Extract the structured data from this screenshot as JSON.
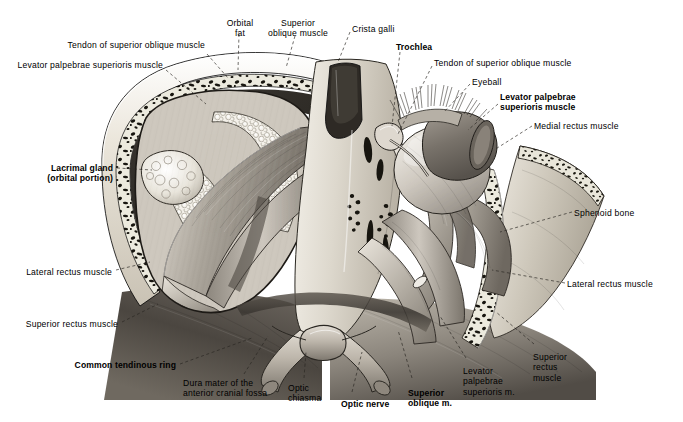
{
  "plate": {
    "title": "Orbital contents, superior view",
    "description": "Anatomical plate: both orbits viewed from above with the orbital roof removed, showing extraocular muscles, lacrimal gland, optic nerves and optic chiasma.",
    "background_color": "#ffffff",
    "ink_color": "#000000"
  },
  "labels": [
    {
      "id": "tendon-superior-oblique-left",
      "text": "Tendon of superior oblique muscle",
      "bold": false,
      "align": "right",
      "x": 205,
      "y": 40,
      "lines": [
        "Tendon of superior oblique muscle"
      ]
    },
    {
      "id": "levator-palpebrae-left",
      "text": "Levator palpebrae superioris muscle",
      "bold": false,
      "align": "right",
      "x": 163,
      "y": 60,
      "lines": [
        "Levator palpebrae superioris muscle"
      ]
    },
    {
      "id": "orbital-fat",
      "text": "Orbital fat",
      "bold": false,
      "align": "center",
      "x": 240,
      "y": 18,
      "lines": [
        "Orbital",
        "fat"
      ]
    },
    {
      "id": "superior-oblique-muscle",
      "text": "Superior oblique muscle",
      "bold": false,
      "align": "center",
      "x": 298,
      "y": 18,
      "lines": [
        "Superior",
        "oblique muscle"
      ]
    },
    {
      "id": "crista-galli",
      "text": "Crista galli",
      "bold": false,
      "align": "left",
      "x": 352,
      "y": 24,
      "lines": [
        "Crista galli"
      ]
    },
    {
      "id": "trochlea",
      "text": "Trochlea",
      "bold": true,
      "align": "left",
      "x": 396,
      "y": 42,
      "lines": [
        "Trochlea"
      ]
    },
    {
      "id": "tendon-superior-oblique-right",
      "text": "Tendon of superior oblique muscle",
      "bold": false,
      "align": "left",
      "x": 434,
      "y": 58,
      "lines": [
        "Tendon of superior oblique muscle"
      ]
    },
    {
      "id": "eyeball",
      "text": "Eyeball",
      "bold": false,
      "align": "left",
      "x": 472,
      "y": 77,
      "lines": [
        "Eyeball"
      ]
    },
    {
      "id": "levator-palpebrae-right",
      "text": "Levator palpebrae superioris muscle",
      "bold": true,
      "align": "left",
      "x": 500,
      "y": 92,
      "lines": [
        "Levator palpebrae",
        "superioris muscle"
      ]
    },
    {
      "id": "medial-rectus-muscle",
      "text": "Medial rectus muscle",
      "bold": false,
      "align": "left",
      "x": 534,
      "y": 121,
      "lines": [
        "Medial rectus muscle"
      ]
    },
    {
      "id": "sphenoid-bone",
      "text": "Sphenoid bone",
      "bold": false,
      "align": "left",
      "x": 574,
      "y": 208,
      "lines": [
        "Sphenoid bone"
      ]
    },
    {
      "id": "lateral-rectus-right",
      "text": "Lateral rectus muscle",
      "bold": false,
      "align": "left",
      "x": 567,
      "y": 279,
      "lines": [
        "Lateral rectus muscle"
      ]
    },
    {
      "id": "superior-rectus-right",
      "text": "Superior rectus muscle",
      "bold": false,
      "align": "left",
      "x": 533,
      "y": 352,
      "lines": [
        "Superior",
        "rectus",
        "muscle"
      ]
    },
    {
      "id": "levator-palpebrae-bottom",
      "text": "Levator palpebrae superioris m.",
      "bold": false,
      "align": "left",
      "x": 463,
      "y": 366,
      "lines": [
        "Levator",
        "palpebrae",
        "superioris m."
      ]
    },
    {
      "id": "superior-oblique-bottom",
      "text": "Superior oblique m.",
      "bold": true,
      "align": "left",
      "x": 408,
      "y": 388,
      "lines": [
        "Superior",
        "oblique m."
      ]
    },
    {
      "id": "optic-nerve",
      "text": "Optic nerve",
      "bold": true,
      "align": "left",
      "x": 341,
      "y": 399,
      "lines": [
        "Optic nerve"
      ]
    },
    {
      "id": "optic-chiasma",
      "text": "Optic chiasma",
      "bold": false,
      "align": "left",
      "x": 288,
      "y": 383,
      "lines": [
        "Optic",
        "chiasma"
      ]
    },
    {
      "id": "dura-mater",
      "text": "Dura mater of the anterior cranial fossa",
      "bold": false,
      "align": "left",
      "x": 183,
      "y": 378,
      "lines": [
        "Dura mater of the",
        "anterior cranial fossa"
      ]
    },
    {
      "id": "common-tendinous-ring",
      "text": "Common tendinous ring",
      "bold": true,
      "align": "right",
      "x": 176,
      "y": 360,
      "lines": [
        "Common tendinous ring"
      ]
    },
    {
      "id": "superior-rectus-left",
      "text": "Superior rectus muscle",
      "bold": false,
      "align": "right",
      "x": 118,
      "y": 319,
      "lines": [
        "Superior rectus muscle"
      ]
    },
    {
      "id": "lateral-rectus-left",
      "text": "Lateral rectus muscle",
      "bold": false,
      "align": "right",
      "x": 112,
      "y": 267,
      "lines": [
        "Lateral rectus muscle"
      ]
    },
    {
      "id": "lacrimal-gland",
      "text": "Lacrimal gland (orbital portion)",
      "bold": true,
      "align": "right",
      "x": 113,
      "y": 163,
      "lines": [
        "Lacrimal gland",
        "(orbital portion)"
      ]
    }
  ],
  "structures": {
    "bone_compact": "#d8d2c6",
    "bone_diploe_dark": "#16140f",
    "muscle_mid": "#9a948b",
    "muscle_light": "#cfc9c0",
    "muscle_dark": "#55504a",
    "fat_light": "#efece5",
    "dura_shadow": "#3c3833",
    "nerve": "#b8b1a6",
    "cavity_dark": "#2a2722"
  }
}
